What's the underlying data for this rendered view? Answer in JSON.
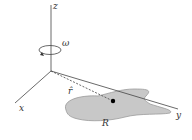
{
  "diagram": {
    "labels": {
      "z_axis": "z",
      "x_axis": "x",
      "y_axis": "y",
      "angular_velocity": "ω",
      "unit_vector": "r̂",
      "region": "R"
    },
    "colors": {
      "region_fill": "#c8c8c8",
      "region_stroke": "#9a9a9a",
      "axis": "#444444",
      "point": "#000000"
    }
  }
}
